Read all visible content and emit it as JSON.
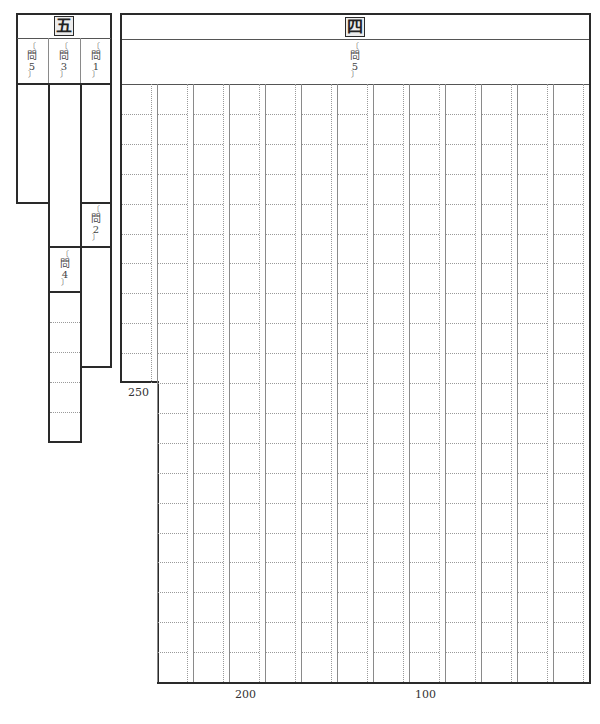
{
  "section5": {
    "header": "五",
    "questions": [
      {
        "id": "q5",
        "label_top": "〔",
        "label_main": "問",
        "label_num": "5",
        "label_bottom": "〕"
      },
      {
        "id": "q3",
        "label_top": "〔",
        "label_main": "問",
        "label_num": "3",
        "label_bottom": "〕"
      },
      {
        "id": "q1",
        "label_top": "〔",
        "label_main": "問",
        "label_num": "1",
        "label_bottom": "〕"
      },
      {
        "id": "q2",
        "label_top": "〔",
        "label_main": "問",
        "label_num": "2",
        "label_bottom": "〕"
      },
      {
        "id": "q4",
        "label_top": "〔",
        "label_main": "問",
        "label_num": "4",
        "label_bottom": "〕"
      }
    ]
  },
  "section4": {
    "header": "四",
    "question": {
      "label_top": "〔",
      "label_main": "問",
      "label_num": "5",
      "label_bottom": "〕"
    },
    "grid": {
      "columns": 13,
      "rows": 20,
      "short_first_column_rows": 10,
      "total_cells": 250
    },
    "markers": [
      {
        "text": "250"
      },
      {
        "text": "200"
      },
      {
        "text": "100"
      }
    ]
  },
  "colors": {
    "border": "#2a2a2a",
    "grid_solid": "#8a8a8a",
    "grid_dotted": "#9a9a9a",
    "header_box_bg": "#ececec"
  }
}
